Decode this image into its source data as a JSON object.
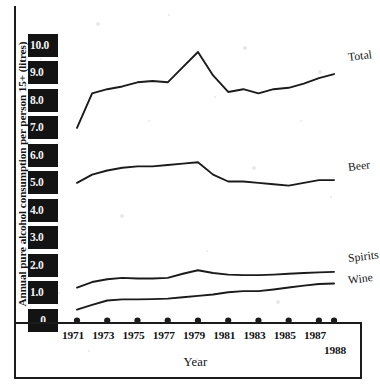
{
  "chart_data": {
    "type": "line",
    "title": "",
    "xlabel": "Year",
    "ylabel": "Annual pure alcohol consumption per person 15+ (litres)",
    "x": [
      1971,
      1972,
      1973,
      1974,
      1975,
      1976,
      1977,
      1978,
      1979,
      1980,
      1981,
      1982,
      1983,
      1984,
      1985,
      1986,
      1987,
      1988
    ],
    "xticklabels": [
      "1971",
      "1973",
      "1975",
      "1977",
      "1979",
      "1981",
      "1983",
      "1985",
      "1987",
      "1988"
    ],
    "xtick_values": [
      1971,
      1973,
      1975,
      1977,
      1979,
      1981,
      1983,
      1985,
      1987,
      1988
    ],
    "yticklabels": [
      "10.0",
      "9.0",
      "8.0",
      "7.0",
      "6.0",
      "5.0",
      "4.0",
      "3.0",
      "2.0",
      "1.0",
      "0"
    ],
    "ytick_values": [
      10.0,
      9.0,
      8.0,
      7.0,
      6.0,
      5.0,
      4.0,
      3.0,
      2.0,
      1.0,
      0
    ],
    "ylim": [
      0,
      10.6
    ],
    "xlim": [
      1970.6,
      1988.6
    ],
    "grid": false,
    "legend_position": "right-of-line-ends",
    "series": [
      {
        "name": "Total",
        "values": [
          7.05,
          8.3,
          8.45,
          8.55,
          8.7,
          8.75,
          8.7,
          9.25,
          9.8,
          8.95,
          8.35,
          8.45,
          8.3,
          8.45,
          8.5,
          8.65,
          8.85,
          9.0
        ]
      },
      {
        "name": "Beer",
        "values": [
          5.05,
          5.35,
          5.5,
          5.6,
          5.65,
          5.65,
          5.7,
          5.75,
          5.8,
          5.35,
          5.1,
          5.1,
          5.05,
          5.0,
          4.95,
          5.05,
          5.15,
          5.15
        ]
      },
      {
        "name": "Spirits",
        "values": [
          1.25,
          1.45,
          1.55,
          1.6,
          1.58,
          1.58,
          1.6,
          1.75,
          1.88,
          1.78,
          1.72,
          1.7,
          1.7,
          1.72,
          1.75,
          1.78,
          1.8,
          1.82
        ]
      },
      {
        "name": "Wine",
        "values": [
          0.45,
          0.62,
          0.78,
          0.82,
          0.82,
          0.83,
          0.85,
          0.9,
          0.95,
          1.0,
          1.08,
          1.12,
          1.12,
          1.18,
          1.25,
          1.32,
          1.38,
          1.4
        ]
      }
    ],
    "colors": {
      "line": "#1b1b1b",
      "axis": "#1b1b1b",
      "tick_block_bg": "#131313",
      "tick_block_text": "#f2f2f2",
      "background": "#ffffff"
    }
  }
}
